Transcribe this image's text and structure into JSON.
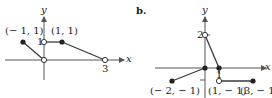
{
  "graph_a": {
    "axis_x_label": "x",
    "axis_y_label": "y",
    "tick_y": "1",
    "tick_x": "3",
    "point_labels": [
      "(− 1, 1)",
      "(1, 1)"
    ],
    "segments": [
      {
        "from": [
          -1,
          1
        ],
        "to": [
          0,
          0
        ],
        "from_filled": true,
        "to_filled": false
      },
      {
        "from": [
          0,
          1
        ],
        "to": [
          1,
          1
        ],
        "from_filled": false,
        "to_filled": true
      },
      {
        "from": [
          1,
          1
        ],
        "to": [
          3,
          0
        ],
        "from_filled": true,
        "to_filled": false
      }
    ]
  },
  "graph_b": {
    "part_label": "b.",
    "axis_x_label": "x",
    "axis_y_label": "y",
    "tick_y": "2",
    "tick_x": "1",
    "point_labels": [
      "(− 2, − 1)",
      "(1, − 1)",
      "(3, − 1)"
    ],
    "segments": [
      {
        "from": [
          -2,
          -1
        ],
        "to": [
          0,
          0
        ],
        "from_filled": true,
        "to_filled": true
      },
      {
        "from": [
          0,
          2
        ],
        "to": [
          1,
          0
        ],
        "from_filled": false,
        "to_filled": true
      },
      {
        "from": [
          1,
          -1
        ],
        "to": [
          3,
          -1
        ],
        "from_filled": false,
        "to_filled": true
      }
    ]
  },
  "colors": {
    "line": "#3a3a3a",
    "axis": "#555555",
    "text": "#1a1a1a"
  }
}
